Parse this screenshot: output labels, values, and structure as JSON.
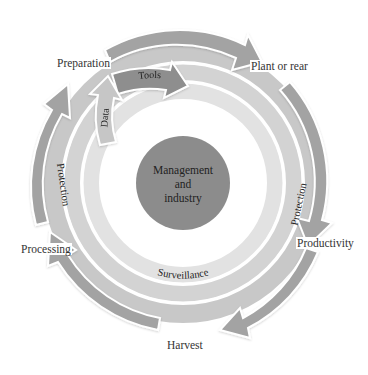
{
  "diagram": {
    "type": "cyclic-process",
    "center": {
      "label_lines": [
        "Management",
        "and",
        "industry"
      ]
    },
    "stages": [
      {
        "label": "Preparation"
      },
      {
        "label": "Plant or rear"
      },
      {
        "label": "Productivity"
      },
      {
        "label": "Harvest"
      },
      {
        "label": "Processing"
      }
    ],
    "rings": {
      "protection_left": "Protection",
      "protection_right": "Protection",
      "surveillance": "Surveillance",
      "data": "Data",
      "tools": "Tools"
    },
    "colors": {
      "outer_arrow": "#a3a3a3",
      "protection_band": "#c8c8c8",
      "surveillance_band": "#d3d3d3",
      "inner_band": "#e2e2e2",
      "center_fill": "#8c8c8c",
      "tools_fill": "#8e8e8e",
      "data_fill": "#c6c6c6",
      "text": "#333333"
    }
  }
}
